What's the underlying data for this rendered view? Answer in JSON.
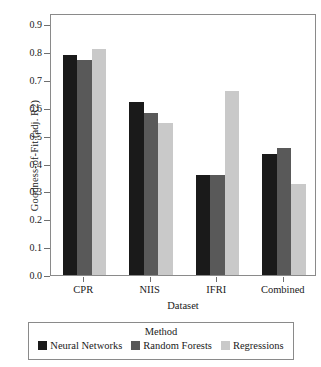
{
  "chart_data": {
    "type": "bar",
    "title": "",
    "xlabel": "Dataset",
    "ylabel": "Goodness-of-Fit (adj. R2)",
    "categories": [
      "CPR",
      "NIIS",
      "IFRI",
      "Combined"
    ],
    "ylim": [
      0.0,
      0.94
    ],
    "yticks": [
      "0.0",
      "0.1",
      "0.2",
      "0.3",
      "0.4",
      "0.5",
      "0.6",
      "0.7",
      "0.8",
      "0.9"
    ],
    "ytick_values": [
      0.0,
      0.1,
      0.2,
      0.3,
      0.4,
      0.5,
      0.6,
      0.7,
      0.8,
      0.9
    ],
    "grid": false,
    "legend_position": "bottom",
    "legend_title": "Method",
    "series": [
      {
        "name": "Neural Networks",
        "color": "#1a1a1a",
        "values": [
          0.79,
          0.62,
          0.36,
          0.435
        ]
      },
      {
        "name": "Random Forests",
        "color": "#595959",
        "values": [
          0.77,
          0.58,
          0.36,
          0.455
        ]
      },
      {
        "name": "Regressions",
        "color": "#c9c9c9",
        "values": [
          0.81,
          0.545,
          0.66,
          0.325
        ]
      }
    ]
  },
  "axis": {
    "frame_color": "#8a8a8a",
    "tick_color": "#6f6f6f"
  }
}
